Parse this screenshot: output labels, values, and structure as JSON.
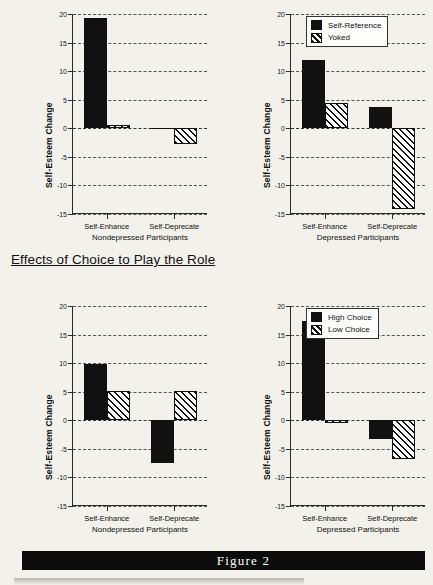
{
  "figure": {
    "banner_label": "Figure 2",
    "section_heading": "Effects of Choice to Play the Role"
  },
  "axis": {
    "ylabel": "Self-Esteem Change",
    "yticks": [
      "20",
      "15",
      "10",
      "5",
      "0",
      "-5",
      "-10",
      "-15"
    ],
    "ymin": -15,
    "ymax": 20,
    "categories": [
      "Self-Enhance",
      "Self-Deprecate"
    ],
    "group_nondepressed": "Nondepressed Participants",
    "group_depressed": "Depressed Participants"
  },
  "chart_data": [
    {
      "type": "bar",
      "title": "",
      "panel": "top-left",
      "xlabel": "Nondepressed Participants",
      "ylabel": "Self-Esteem Change",
      "ylim": [
        -15,
        20
      ],
      "yticks": [
        20,
        15,
        10,
        5,
        0,
        -5,
        -10,
        -15
      ],
      "grid": true,
      "legend": "none",
      "categories": [
        "Self-Enhance",
        "Self-Deprecate"
      ],
      "series": [
        {
          "name": "Self-Reference",
          "values": [
            19.3,
            -0.15
          ]
        },
        {
          "name": "Yoked",
          "values": [
            0.6,
            -2.8
          ]
        }
      ]
    },
    {
      "type": "bar",
      "title": "",
      "panel": "top-right",
      "xlabel": "Depressed Participants",
      "ylabel": "Self-Esteem Change",
      "ylim": [
        -15,
        20
      ],
      "yticks": [
        20,
        15,
        10,
        5,
        0,
        -5,
        -10,
        -15
      ],
      "grid": true,
      "legend": "top-right",
      "categories": [
        "Self-Enhance",
        "Self-Deprecate"
      ],
      "series": [
        {
          "name": "Self-Reference",
          "values": [
            12.0,
            3.8
          ]
        },
        {
          "name": "Yoked",
          "values": [
            4.4,
            -14.2
          ]
        }
      ]
    },
    {
      "type": "bar",
      "title": "",
      "panel": "bottom-left",
      "xlabel": "Nondepressed Participants",
      "ylabel": "Self-Esteem Change",
      "ylim": [
        -15,
        20
      ],
      "yticks": [
        20,
        15,
        10,
        5,
        0,
        -5,
        -10,
        -15
      ],
      "grid": true,
      "legend": "none",
      "categories": [
        "Self-Enhance",
        "Self-Deprecate"
      ],
      "series": [
        {
          "name": "High Choice",
          "values": [
            9.8,
            -7.5
          ]
        },
        {
          "name": "Low Choice",
          "values": [
            5.2,
            5.1
          ]
        }
      ]
    },
    {
      "type": "bar",
      "title": "",
      "panel": "bottom-right",
      "xlabel": "Depressed Participants",
      "ylabel": "Self-Esteem Change",
      "ylim": [
        -15,
        20
      ],
      "yticks": [
        20,
        15,
        10,
        5,
        0,
        -5,
        -10,
        -15
      ],
      "grid": true,
      "legend": "top-right",
      "categories": [
        "Self-Enhance",
        "Self-Deprecate"
      ],
      "series": [
        {
          "name": "High Choice",
          "values": [
            17.4,
            -3.3
          ]
        },
        {
          "name": "Low Choice",
          "values": [
            -0.4,
            -6.7
          ]
        }
      ]
    }
  ],
  "legends": {
    "top": [
      {
        "label": "Self-Reference",
        "pattern": "solid"
      },
      {
        "label": "Yoked",
        "pattern": "hatch"
      }
    ],
    "bottom": [
      {
        "label": "High Choice",
        "pattern": "solid"
      },
      {
        "label": "Low Choice",
        "pattern": "hatch"
      }
    ]
  }
}
